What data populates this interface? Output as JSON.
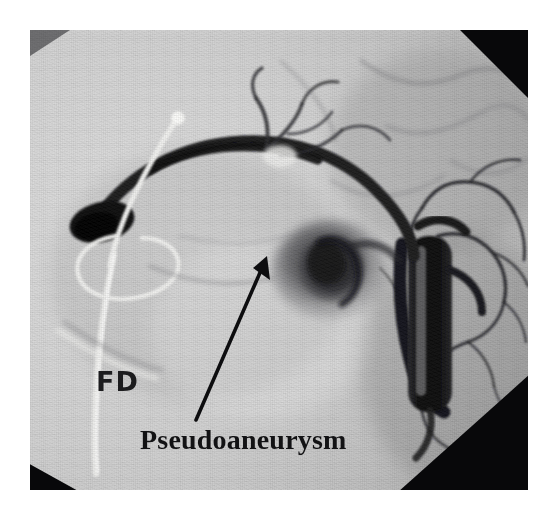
{
  "figure": {
    "modality": "digital-subtraction-angiography",
    "caption_labels": {
      "fd": "FD",
      "pseudoaneurysm": "Pseudoaneurysm"
    }
  },
  "annotations": [
    {
      "name": "fd-marker",
      "text": "FD",
      "font": "sans-serif",
      "x": 66,
      "y": 336
    },
    {
      "name": "pseudoaneurysm-label",
      "text": "Pseudoaneurysm",
      "font": "serif",
      "x": 110,
      "y": 394
    }
  ],
  "pointer": {
    "name": "pseudoaneurysm-arrow",
    "from_x": 196,
    "from_y": 420,
    "to_x": 267,
    "to_y": 258,
    "color": "#0d0d0f",
    "points_to": "Pseudoaneurysm"
  },
  "colors": {
    "background": "#ffffff",
    "field": "#c9c9c9",
    "contrast_dark": "#141416",
    "vignette": "#08080a",
    "wire_white": "#f4f4f2",
    "label_ink": "#17171a"
  },
  "plate": {
    "left": 30,
    "top": 30,
    "width": 498,
    "height": 460
  },
  "structures": [
    {
      "name": "guide-wire",
      "appearance": "white radiopaque wire with distal loop"
    },
    {
      "name": "catheter-shaft",
      "appearance": "vertical white catheter along left field"
    },
    {
      "name": "contrast-filled-artery",
      "appearance": "dark curved arc across upper field"
    },
    {
      "name": "pseudoaneurysm-sac",
      "appearance": "rounded dark contrast collection, mid field"
    },
    {
      "name": "aortic-contrast-column",
      "appearance": "dense black vertical column, right field"
    },
    {
      "name": "branch-vessels",
      "appearance": "fine dark branching vessels, right field"
    }
  ]
}
